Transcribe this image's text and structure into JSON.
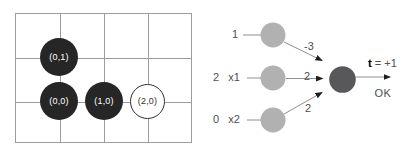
{
  "grid": {
    "points": [
      {
        "label": "(0,1)"
      },
      {
        "label": "(0,0)"
      },
      {
        "label": "(1,0)"
      },
      {
        "label": "(2,0)"
      }
    ]
  },
  "net": {
    "inputs": [
      {
        "value": "1",
        "name": "",
        "weight": "-3"
      },
      {
        "value": "2",
        "name": "x1",
        "weight": "2"
      },
      {
        "value": "0",
        "name": "x2",
        "weight": "2"
      }
    ],
    "output": {
      "t": "t",
      "eq": "= +1",
      "ok": "OK"
    }
  },
  "colors": {
    "grid_node_fill": "#262626",
    "grid_node_text": "#ffffff",
    "empty_node_border": "#2f2f2f",
    "input_node": "#b1b1b1",
    "output_node": "#58585a",
    "line": "#909090",
    "arrowhead": "#1f1f1f"
  }
}
